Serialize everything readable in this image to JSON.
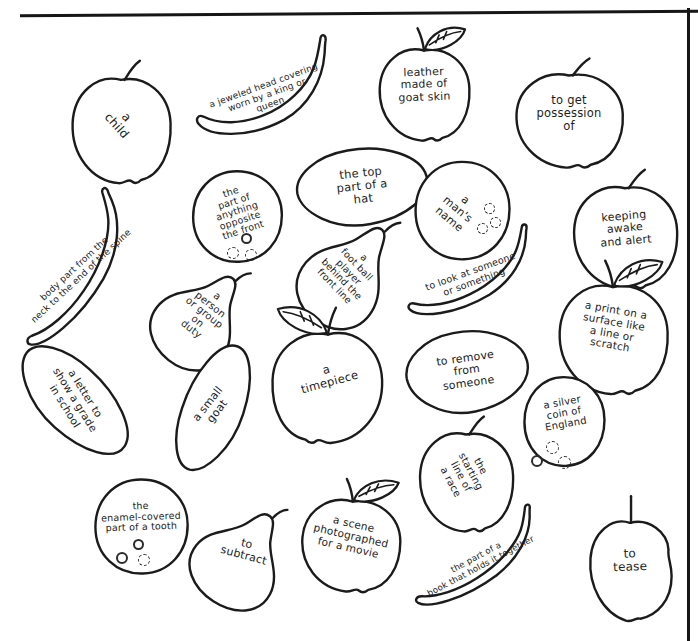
{
  "page": {
    "background": "#ffffff",
    "ink_color": "#1b1b1b",
    "text_color": "#1d1d1d"
  },
  "fruits": [
    {
      "id": "child",
      "type": "apple",
      "clue": "a\nchild"
    },
    {
      "id": "crown",
      "type": "banana",
      "clue": "a jeweled head covering\nworn by a king or\nqueen"
    },
    {
      "id": "leather",
      "type": "apple-with-leaf",
      "clue": "leather\nmade of\ngoat skin"
    },
    {
      "id": "possession",
      "type": "apple",
      "clue": "to get\npossession\nof"
    },
    {
      "id": "back",
      "type": "orange",
      "clue": "the\npart of\nanything\nopposite\nthe front"
    },
    {
      "id": "hat",
      "type": "lemon",
      "clue": "the top\npart of a\nhat"
    },
    {
      "id": "name",
      "type": "orange",
      "clue": "a\nman's\nname"
    },
    {
      "id": "awake",
      "type": "apple",
      "clue": "keeping\nawake\nand alert"
    },
    {
      "id": "spine",
      "type": "banana",
      "clue": "body part from the\nneck to the end of the spine"
    },
    {
      "id": "fullback",
      "type": "pear",
      "clue": "a\nfoot ball\nplayer\nbehind the\nfront line"
    },
    {
      "id": "duty",
      "type": "pear",
      "clue": "a\nperson\nor group\non\nduty"
    },
    {
      "id": "look",
      "type": "banana",
      "clue": "to look at someone\nor something"
    },
    {
      "id": "print",
      "type": "apple-with-leaf",
      "clue": "a print on a\nsurface like\na line or\nscratch"
    },
    {
      "id": "grade",
      "type": "lemon",
      "clue": "a letter to\nshow a grade\nin school"
    },
    {
      "id": "goat",
      "type": "lemon",
      "clue": "a small\ngoat"
    },
    {
      "id": "timepiece",
      "type": "apple-with-leaf",
      "clue": "a\ntimepiece"
    },
    {
      "id": "remove",
      "type": "lemon",
      "clue": "to remove\nfrom\nsomeone"
    },
    {
      "id": "coin",
      "type": "orange",
      "clue": "a silver\ncoin of\nEngland"
    },
    {
      "id": "start",
      "type": "apple",
      "clue": "the\nstarting\nline of\na race"
    },
    {
      "id": "tooth",
      "type": "orange",
      "clue": "the\nenamel-covered\npart of a tooth"
    },
    {
      "id": "subtract",
      "type": "pear",
      "clue": "to\nsubtract"
    },
    {
      "id": "movie",
      "type": "apple-with-leaf",
      "clue": "a scene\nphotographed\nfor a movie"
    },
    {
      "id": "book",
      "type": "banana",
      "clue": "the part of a\nbook that holds it together"
    },
    {
      "id": "tease",
      "type": "apple",
      "clue": "to\ntease"
    }
  ]
}
